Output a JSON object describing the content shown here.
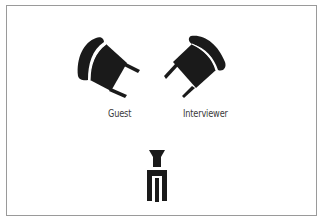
{
  "diagram": {
    "title": "",
    "labels": {
      "guest": "Guest",
      "interviewer": "Interviewer"
    },
    "elements": [
      {
        "id": "guest-chair",
        "icon": "chair-icon",
        "label": "Guest"
      },
      {
        "id": "interviewer-chair",
        "icon": "chair-icon",
        "label": "Interviewer"
      },
      {
        "id": "camera",
        "icon": "camera-on-tripod-icon",
        "label": ""
      }
    ],
    "colors": {
      "ink": "#1a1a1a",
      "border": "#9a9a9a",
      "background": "#ffffff",
      "text": "#3a3a3a"
    }
  }
}
